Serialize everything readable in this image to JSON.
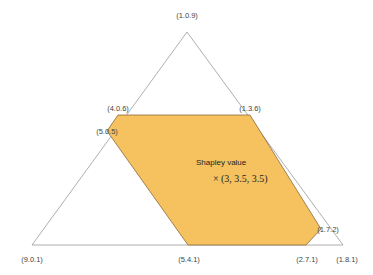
{
  "diagram": {
    "type": "simplex-core",
    "triangle_vertices": [
      {
        "label": "(1.0.9)",
        "x": 187,
        "y": 32
      },
      {
        "label": "(9.0.1)",
        "x": 32,
        "y": 245
      },
      {
        "label": "(1.8.1)",
        "x": 343,
        "y": 245
      }
    ],
    "core_vertices": [
      {
        "label": "(4.0.6)",
        "x": 118,
        "y": 115
      },
      {
        "label": "(1.3.6)",
        "x": 250,
        "y": 115
      },
      {
        "label": "(1.7.2)",
        "x": 321,
        "y": 229
      },
      {
        "label": "(2.7.1)",
        "x": 306,
        "y": 245
      },
      {
        "label": "(5.4.1)",
        "x": 188,
        "y": 245
      },
      {
        "label": "(5.0.5)",
        "x": 107,
        "y": 131
      }
    ],
    "core_fill": "#f6c260",
    "core_stroke": "#8a6a3a",
    "triangle_stroke": "#9a9a9a",
    "shapley": {
      "title": "Shapley value",
      "marker": "×",
      "value": "(3, 3.5, 3.5)"
    }
  }
}
